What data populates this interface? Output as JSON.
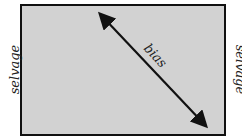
{
  "diagram": {
    "labels": {
      "left": "selvage",
      "right": "selvage",
      "arrow": "bias"
    },
    "colors": {
      "fabric": "#d2d2d2",
      "border": "#111111",
      "arrow": "#111111"
    }
  }
}
